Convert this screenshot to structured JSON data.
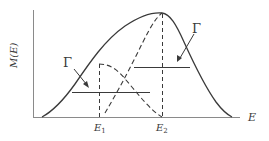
{
  "figure": {
    "type": "diagram",
    "colors": {
      "line": "#3a3a3a",
      "axis": "#8a8a8a",
      "background": "#ffffff"
    },
    "axes": {
      "y_label": "M(E)",
      "x_label": "E"
    },
    "ticks": {
      "e1": {
        "base": "E",
        "sub": "1"
      },
      "e2": {
        "base": "E",
        "sub": "2"
      }
    },
    "annotations": {
      "gamma_left": "Γ",
      "gamma_right": "Γ"
    },
    "curves": [
      {
        "name": "total",
        "style": "solid",
        "peak_at": "E2"
      },
      {
        "name": "component-1",
        "style": "dashed",
        "peak_at": "E1"
      },
      {
        "name": "component-2",
        "style": "dashed",
        "peak_at": "E2"
      }
    ]
  }
}
